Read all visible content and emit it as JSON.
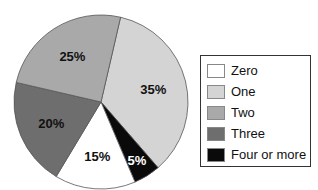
{
  "chart_data": {
    "type": "pie",
    "title": "",
    "categories": [
      "Zero",
      "One",
      "Two",
      "Three",
      "Four or more"
    ],
    "values": [
      15,
      35,
      25,
      20,
      5
    ],
    "labels": [
      "15%",
      "35%",
      "25%",
      "20%",
      "5%"
    ],
    "colors": [
      "#ffffff",
      "#d4d4d4",
      "#a9a9a9",
      "#6e6e6e",
      "#0a0a0a"
    ],
    "label_colors": [
      "#111111",
      "#111111",
      "#111111",
      "#111111",
      "#ffffff"
    ],
    "legend_position": "right"
  },
  "legend": {
    "items": [
      {
        "label": "Zero",
        "color": "#ffffff"
      },
      {
        "label": "One",
        "color": "#d4d4d4"
      },
      {
        "label": "Two",
        "color": "#a9a9a9"
      },
      {
        "label": "Three",
        "color": "#6e6e6e"
      },
      {
        "label": "Four or more",
        "color": "#0a0a0a"
      }
    ]
  }
}
